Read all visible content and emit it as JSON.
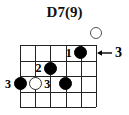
{
  "chord": {
    "title": "D7(9)",
    "strings": 6,
    "frets": 4,
    "start_fret_label": "3",
    "arrow_icon": "arrow-left-icon",
    "open_string_marker": {
      "string": 6,
      "symbol": "open-circle"
    },
    "left_fret_label": "3",
    "notes": [
      {
        "string": 5,
        "fret": 1,
        "finger": "1",
        "type": "filled"
      },
      {
        "string": 3,
        "fret": 2,
        "finger": "2",
        "type": "filled"
      },
      {
        "string": 1,
        "fret": 3,
        "finger": "3",
        "type": "filled"
      },
      {
        "string": 2,
        "fret": 3,
        "finger": "3",
        "type": "open"
      },
      {
        "string": 4,
        "fret": 3,
        "finger": "",
        "type": "filled"
      }
    ]
  }
}
